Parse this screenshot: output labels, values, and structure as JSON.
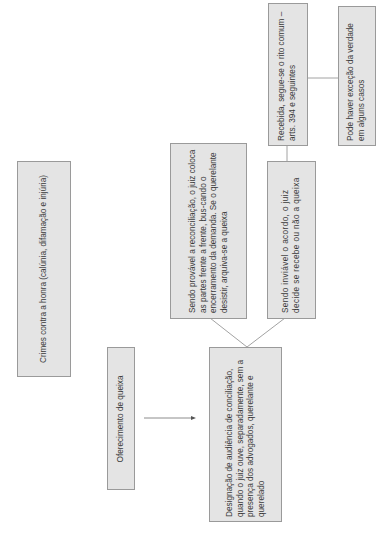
{
  "diagram": {
    "orientation": "rotated-90-ccw",
    "nodes": [
      {
        "id": "crimes",
        "text": "Crimes contra a honra (calúnia, difamação e injúria)"
      },
      {
        "id": "oferecimento",
        "text": "Oferecimento de queixa"
      },
      {
        "id": "designacao",
        "text": "Designação de audiência de conciliação, quando o juiz ouve, separadamente, sem a presença dos advogados, querelante e querelado"
      },
      {
        "id": "provavel",
        "text": "Sendo provável a reconciliação, o juiz coloca as partes frente a frente, bus-cando o encerramento da demanda. Se o querelante desistir, arquiva-se a queixa"
      },
      {
        "id": "inviavel",
        "text": "Sendo inviável o acordo, o juiz decide se recebe ou não a queixa"
      },
      {
        "id": "recebida",
        "text": "Recebida, segue-se o rito comum – arts. 394 e seguintes"
      },
      {
        "id": "excecao",
        "text": "Pode haver exceção da verdade em alguns casos"
      }
    ],
    "edges": [
      {
        "from": "oferecimento",
        "to": "designacao",
        "type": "arrow"
      },
      {
        "from": "designacao",
        "to": "provavel",
        "type": "line"
      },
      {
        "from": "designacao",
        "to": "inviavel",
        "type": "line"
      },
      {
        "from": "inviavel",
        "to": "recebida",
        "type": "line"
      },
      {
        "from": "recebida",
        "to": "excecao",
        "type": "line"
      }
    ],
    "colors": {
      "box_fill": "#e4e4e4",
      "box_border": "#9a9a9a",
      "text": "#3a3a3a",
      "line": "#6f6f6f"
    }
  }
}
